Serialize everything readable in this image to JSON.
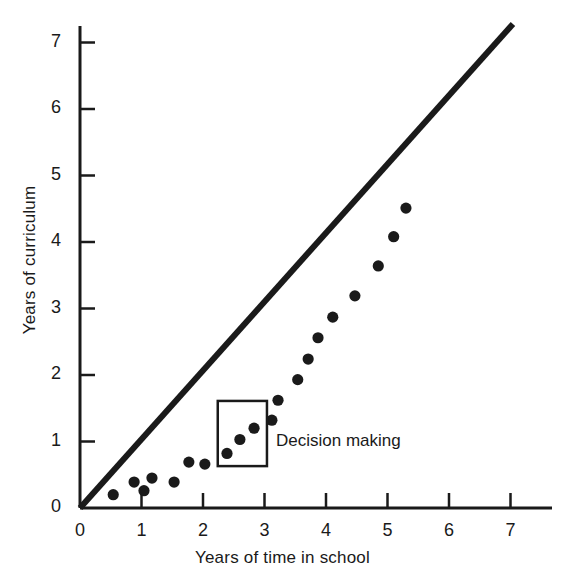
{
  "chart_data": {
    "type": "scatter",
    "title": "",
    "xlabel": "Years of time in school",
    "ylabel": "Years of curriculum",
    "xlim": [
      0,
      7.6
    ],
    "ylim": [
      0,
      7.45
    ],
    "grid": false,
    "legend": null,
    "xticks": [
      0,
      1,
      2,
      3,
      4,
      5,
      6,
      7
    ],
    "yticks": [
      0,
      1,
      2,
      3,
      4,
      5,
      6,
      7
    ],
    "xticklabels": [
      "0",
      "1",
      "2",
      "3",
      "4",
      "5",
      "6",
      "7"
    ],
    "yticklabels": [
      "0",
      "1",
      "2",
      "3",
      "4",
      "5",
      "6",
      "7"
    ],
    "series": [
      {
        "name": "reference-line",
        "type": "line",
        "points": [
          [
            0,
            0
          ],
          [
            7.04,
            7.28
          ]
        ]
      },
      {
        "name": "observed",
        "type": "scatter",
        "x": [
          0.54,
          0.88,
          1.04,
          1.17,
          1.53,
          1.77,
          2.03,
          2.39,
          2.6,
          2.83,
          3.12,
          3.22,
          3.54,
          3.71,
          3.87,
          4.11,
          4.47,
          4.85,
          5.1,
          5.3
        ],
        "y": [
          0.2,
          0.39,
          0.26,
          0.45,
          0.39,
          0.69,
          0.66,
          0.82,
          1.03,
          1.2,
          1.32,
          1.62,
          1.93,
          2.24,
          2.56,
          2.87,
          3.19,
          3.64,
          4.08,
          4.51
        ]
      }
    ],
    "annotations": [
      {
        "name": "decision-making-box",
        "label": "Decision making",
        "shape": "rectangle",
        "x0": 2.24,
        "x1": 3.04,
        "y0": 0.63,
        "y1": 1.61,
        "label_x": 3.19,
        "label_y": 1.08
      }
    ],
    "colors": {
      "line": "#1a1a1a",
      "marker": "#1a1a1a",
      "axis": "#1a1a1a",
      "background": "#ffffff",
      "annotation_box": "#1a1a1a"
    }
  }
}
